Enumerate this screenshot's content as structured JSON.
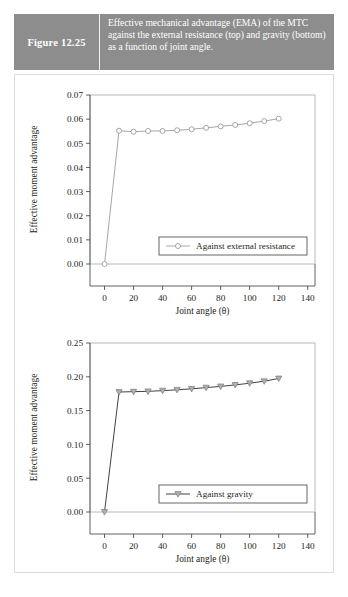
{
  "figure": {
    "label": "Figure 12.25",
    "caption": "Effective mechanical advantage (EMA) of the MTC against the external resistance (top) and gravity (bottom) as a function of joint angle.",
    "band_color": "#8d8d8d",
    "band_text_color": "#ffffff"
  },
  "chart_data": [
    {
      "id": "top",
      "type": "line",
      "title": "",
      "xlabel": "Joint angle (θ)",
      "ylabel": "Effective moment advantage",
      "xlim": [
        -10,
        145
      ],
      "ylim": [
        0.0,
        0.07
      ],
      "xticks": [
        0,
        20,
        40,
        60,
        80,
        100,
        120,
        140
      ],
      "xticklabels": [
        "0",
        "20",
        "40",
        "60",
        "80",
        "100",
        "120",
        "140"
      ],
      "yticks": [
        0.0,
        0.01,
        0.02,
        0.03,
        0.04,
        0.05,
        0.06,
        0.07
      ],
      "yticklabels": [
        "0.00",
        "0.01",
        "0.02",
        "0.03",
        "0.04",
        "0.05",
        "0.06",
        "0.07"
      ],
      "grid": false,
      "legend_position": "lower right",
      "series": [
        {
          "name": "Against external resistance",
          "marker": "circle-open",
          "color": "#9c9c9c",
          "x": [
            0,
            10,
            20,
            30,
            40,
            50,
            60,
            70,
            80,
            90,
            100,
            110,
            120
          ],
          "y": [
            0.0,
            0.0552,
            0.0548,
            0.0551,
            0.0551,
            0.0554,
            0.0558,
            0.0564,
            0.057,
            0.0576,
            0.0583,
            0.0592,
            0.0602,
            0.061
          ]
        }
      ]
    },
    {
      "id": "bottom",
      "type": "line",
      "title": "",
      "xlabel": "Joint angle (θ)",
      "ylabel": "Effective moment advantage",
      "xlim": [
        -10,
        145
      ],
      "ylim": [
        0.0,
        0.25
      ],
      "xticks": [
        0,
        20,
        40,
        60,
        80,
        100,
        120,
        140
      ],
      "xticklabels": [
        "0",
        "20",
        "40",
        "60",
        "80",
        "100",
        "120",
        "140"
      ],
      "yticks": [
        0.0,
        0.05,
        0.1,
        0.15,
        0.2,
        0.25
      ],
      "yticklabels": [
        "0.00",
        "0.05",
        "0.10",
        "0.15",
        "0.20",
        "0.25"
      ],
      "grid": false,
      "legend_position": "lower right",
      "series": [
        {
          "name": "Against gravity",
          "marker": "triangle-down",
          "color": "#2b2b2b",
          "x": [
            0,
            10,
            20,
            30,
            40,
            50,
            60,
            70,
            80,
            90,
            100,
            110,
            120
          ],
          "y": [
            0.0,
            0.1775,
            0.178,
            0.1785,
            0.1795,
            0.1808,
            0.1822,
            0.184,
            0.1858,
            0.188,
            0.1905,
            0.1935,
            0.1975
          ]
        }
      ]
    }
  ]
}
